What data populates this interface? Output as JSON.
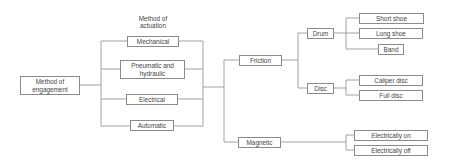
{
  "diagram": {
    "root": {
      "label": "Method of engagement"
    },
    "actuation_header": "Method of actuation",
    "actuation": [
      {
        "label": "Mechanical"
      },
      {
        "label": "Pneumatic and hydraulic"
      },
      {
        "label": "Electrical"
      },
      {
        "label": "Automatic"
      }
    ],
    "types": [
      {
        "label": "Friction"
      },
      {
        "label": "Magnetic"
      }
    ],
    "friction_types": [
      {
        "label": "Drum"
      },
      {
        "label": "Disc"
      }
    ],
    "drum_types": [
      {
        "label": "Short shoe"
      },
      {
        "label": "Long shoe"
      },
      {
        "label": "Band"
      }
    ],
    "disc_types": [
      {
        "label": "Caliper disc"
      },
      {
        "label": "Full disc"
      }
    ],
    "magnetic_types": [
      {
        "label": "Electrically on"
      },
      {
        "label": "Electrically off"
      }
    ],
    "colors": {
      "line": "#8a8a8a",
      "text": "#444444",
      "background": "#ffffff"
    }
  }
}
